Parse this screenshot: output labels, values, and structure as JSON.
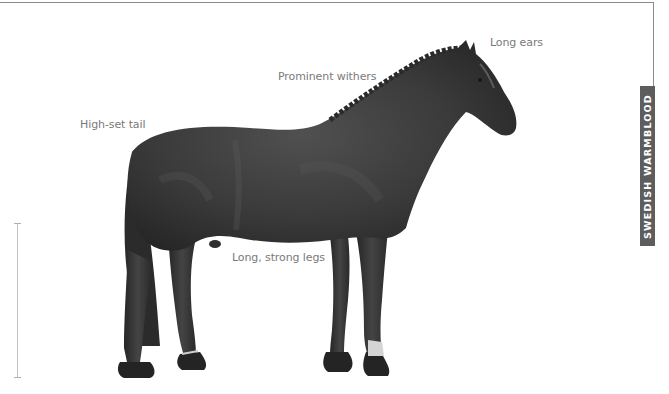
{
  "page": {
    "side_tab": {
      "label": "SWEDISH WARMBLOOD",
      "color": "#5d5d5d"
    },
    "illustration": {
      "subject": "horse-illustration",
      "coat_color": "#3a3a3a"
    },
    "labels": [
      {
        "id": "long-ears",
        "text": "Long ears"
      },
      {
        "id": "prominent-withers",
        "text": "Prominent withers"
      },
      {
        "id": "high-set-tail",
        "text": "High-set tail"
      },
      {
        "id": "long-strong-legs",
        "text": "Long, strong legs"
      }
    ],
    "scale_bar": {
      "label": ""
    }
  }
}
